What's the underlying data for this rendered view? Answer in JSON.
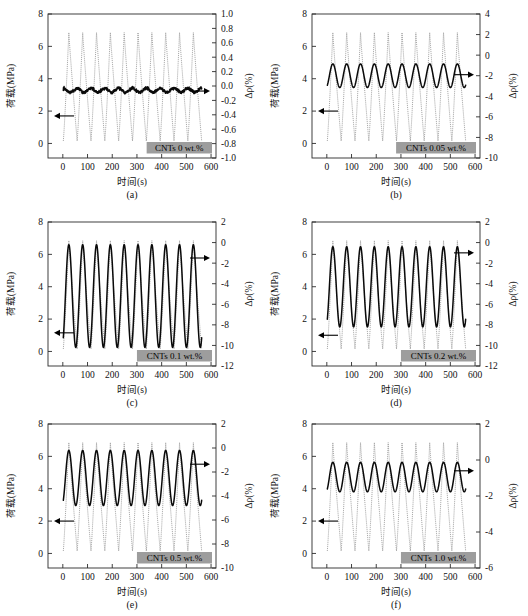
{
  "figure": {
    "xlabel": "时间(s)",
    "ylabel_left": "荷载(MPa)",
    "ylabel_right": "Δρ(%)",
    "x_ticks": [
      0,
      100,
      200,
      300,
      400,
      500,
      600
    ],
    "xlim": [
      -60,
      620
    ],
    "y_left_ticks": [
      0,
      2,
      4,
      6,
      8
    ],
    "ylim_left": [
      -0.9,
      8
    ],
    "n_cycles": 10,
    "load_period": 56,
    "load_start": 2,
    "load_min": 0.15,
    "load_max": 6.85
  },
  "chart_data": {
    "type": "line",
    "title": "",
    "xlabel": "时间(s)",
    "ylabel": "荷载(MPa)",
    "ylabel2": "Δρ(%)",
    "xlim": [
      0,
      600
    ],
    "panels": [
      {
        "id": "a",
        "panel_label": "(a)",
        "badge": "CNTs 0 wt.%",
        "ylim_right": [
          -1.0,
          1.0
        ],
        "y_right_ticks": [
          1.0,
          0.8,
          0.6,
          0.4,
          0.2,
          0.0,
          -0.2,
          -0.4,
          -0.6,
          -0.8,
          -1.0
        ],
        "y_right_tick_labels": [
          "1.0",
          "0.8",
          "0.6",
          "0.4",
          "0.2",
          "0.0",
          "-0.2",
          "-0.4",
          "-0.6",
          "-0.8",
          "-1.0"
        ],
        "rho_baseline": -0.06,
        "rho_amplitude": 0.05,
        "rho_phase": "noisy-flat",
        "rho_noise": 0.028,
        "left_arrow_y": 1.7,
        "right_arrow_y": -0.07,
        "series": [
          {
            "name": "荷载(MPa)",
            "style": "dotted-gray",
            "axis": "left"
          },
          {
            "name": "Δρ(%)",
            "style": "solid-black",
            "axis": "right"
          }
        ]
      },
      {
        "id": "b",
        "panel_label": "(b)",
        "badge": "CNTs 0.05 wt.%",
        "ylim_right": [
          -10,
          4
        ],
        "y_right_ticks": [
          4,
          2,
          0,
          -2,
          -4,
          -6,
          -8,
          -10
        ],
        "y_right_tick_labels": [
          "4",
          "2",
          "0",
          "-2",
          "-4",
          "-6",
          "-8",
          "-10"
        ],
        "rho_baseline": -2.0,
        "rho_amplitude": 1.15,
        "rho_phase": "in-phase",
        "rho_noise": 0.0,
        "left_arrow_y": 2.0,
        "right_arrow_y": -1.9,
        "series": [
          {
            "name": "荷载(MPa)",
            "style": "dotted-gray",
            "axis": "left"
          },
          {
            "name": "Δρ(%)",
            "style": "solid-black",
            "axis": "right"
          }
        ]
      },
      {
        "id": "c",
        "panel_label": "(c)",
        "badge": "CNTs 0.1 wt.%",
        "ylim_right": [
          -12,
          2
        ],
        "y_right_ticks": [
          2,
          0,
          -2,
          -4,
          -6,
          -8,
          -10,
          -12
        ],
        "y_right_tick_labels": [
          "2",
          "0",
          "-2",
          "-4",
          "-6",
          "-8",
          "-10",
          "-12"
        ],
        "rho_baseline": -5.2,
        "rho_amplitude": 5.0,
        "rho_phase": "in-phase",
        "rho_noise": 0.0,
        "left_arrow_y": 1.15,
        "right_arrow_y": -1.5,
        "series": [
          {
            "name": "荷载(MPa)",
            "style": "dotted-gray",
            "axis": "left"
          },
          {
            "name": "Δρ(%)",
            "style": "solid-black",
            "axis": "right"
          }
        ]
      },
      {
        "id": "d",
        "panel_label": "(d)",
        "badge": "CNTs 0.2 wt.%",
        "ylim_right": [
          -12,
          2
        ],
        "y_right_ticks": [
          2,
          0,
          -2,
          -4,
          -6,
          -8,
          -10,
          -12
        ],
        "y_right_tick_labels": [
          "2",
          "0",
          "-2",
          "-4",
          "-6",
          "-8",
          "-10",
          "-12"
        ],
        "rho_baseline": -4.3,
        "rho_amplitude": 3.9,
        "rho_phase": "in-phase",
        "rho_noise": 0.0,
        "left_arrow_y": 1.0,
        "right_arrow_y": -1.0,
        "series": [
          {
            "name": "荷载(MPa)",
            "style": "dotted-gray",
            "axis": "left"
          },
          {
            "name": "Δρ(%)",
            "style": "solid-black",
            "axis": "right"
          }
        ]
      },
      {
        "id": "e",
        "panel_label": "(e)",
        "badge": "CNTs 0.5 wt.%",
        "ylim_right": [
          -10,
          2
        ],
        "y_right_ticks": [
          2,
          0,
          -2,
          -4,
          -6,
          -8,
          -10
        ],
        "y_right_tick_labels": [
          "2",
          "0",
          "-2",
          "-4",
          "-6",
          "-8",
          "-10"
        ],
        "rho_baseline": -2.5,
        "rho_amplitude": 2.3,
        "rho_phase": "in-phase",
        "rho_noise": 0.0,
        "left_arrow_y": 2.0,
        "right_arrow_y": -1.35,
        "series": [
          {
            "name": "荷载(MPa)",
            "style": "dotted-gray",
            "axis": "left"
          },
          {
            "name": "Δρ(%)",
            "style": "solid-black",
            "axis": "right"
          }
        ]
      },
      {
        "id": "f",
        "panel_label": "(f)",
        "badge": "CNTs 1.0 wt.%",
        "ylim_right": [
          -6,
          2
        ],
        "y_right_ticks": [
          2,
          0,
          -2,
          -4,
          -6
        ],
        "y_right_tick_labels": [
          "2",
          "0",
          "-2",
          "-4",
          "-6"
        ],
        "rho_baseline": -0.95,
        "rho_amplitude": 0.82,
        "rho_phase": "in-phase",
        "rho_noise": 0.0,
        "left_arrow_y": 2.0,
        "right_arrow_y": -0.6,
        "series": [
          {
            "name": "荷载(MPa)",
            "style": "dotted-gray",
            "axis": "left"
          },
          {
            "name": "Δρ(%)",
            "style": "solid-black",
            "axis": "right"
          }
        ]
      }
    ]
  }
}
